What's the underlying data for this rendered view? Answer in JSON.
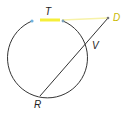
{
  "diagram": {
    "type": "geometry-circle-secant-tangent",
    "labels": {
      "T": "T",
      "D": "D",
      "V": "V",
      "R": "R"
    },
    "colors": {
      "stroke": "#333333",
      "highlight": "#f5ee3a",
      "point_blue": "#6fb3e0",
      "point_D": "#e3d94a",
      "background": "#ffffff"
    }
  }
}
